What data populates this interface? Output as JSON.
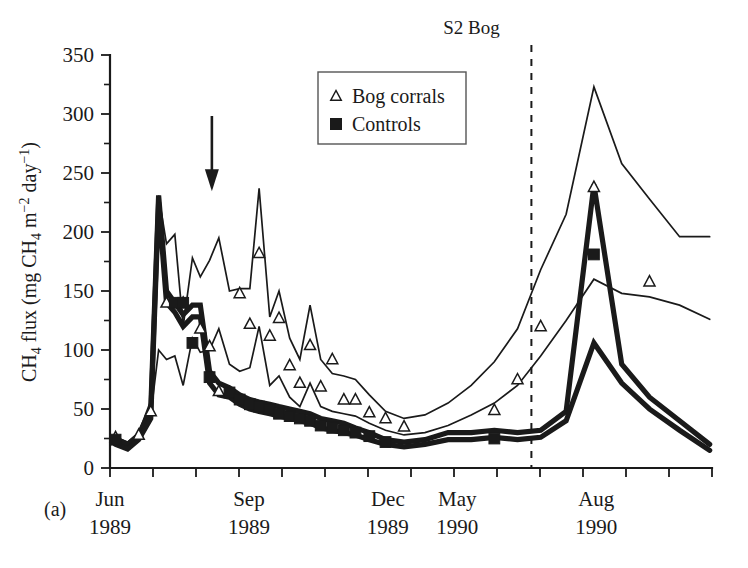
{
  "figure": {
    "panel_label": "(a)",
    "title": "S2 Bog"
  },
  "axes": {
    "y_label_parts": {
      "full": "CH4 flux (mg CH4 m-2 day-1)",
      "prefix": "CH",
      "sub1": "4",
      "mid": " flux (mg CH",
      "sub2": "4",
      "mid2": " m",
      "sup1": "−2",
      "mid3": " day",
      "sup2": "−1",
      "suffix": ")"
    },
    "y_ticks": [
      "0",
      "50",
      "100",
      "150",
      "200",
      "250",
      "300",
      "350"
    ],
    "y_minor_ticks": [
      25,
      75,
      125,
      175,
      225,
      275,
      325
    ],
    "y_range": [
      0,
      350
    ],
    "x_ticks": [
      {
        "label": "Jun",
        "year": "1989"
      },
      {
        "label": "Sep",
        "year": "1989"
      },
      {
        "label": "Dec",
        "year": "1989"
      },
      {
        "label": "May",
        "year": "1990"
      },
      {
        "label": "Aug",
        "year": "1990"
      }
    ],
    "x_tick_count": 14
  },
  "legend": {
    "position": "top-center-left",
    "entries": [
      {
        "label": "Bog corrals",
        "marker": "open-triangle"
      },
      {
        "label": "Controls",
        "marker": "filled-square"
      }
    ]
  },
  "annotations": {
    "arrow": {
      "name": "treatment-arrow",
      "x_index": 2.2,
      "y_top": 300,
      "y_bottom": 248
    },
    "divider": {
      "name": "year-break-divider",
      "x_index": 9.1,
      "style": "dashed"
    }
  },
  "chart_data": {
    "type": "line",
    "title": "S2 Bog",
    "xlabel": "",
    "ylabel": "CH4 flux (mg CH4 m-2 day-1)",
    "ylim": [
      0,
      350
    ],
    "xlim": [
      0,
      13
    ],
    "grid": false,
    "legend_position": "upper-center",
    "x_tick_positions": [
      0,
      3,
      6,
      7.5,
      10.5
    ],
    "x_tick_labels": [
      "Jun 1989",
      "Sep 1989",
      "Dec 1989",
      "May 1990",
      "Aug 1990"
    ],
    "series": [
      {
        "name": "Bog corrals upper envelope",
        "marker": "none",
        "style": "thin",
        "x": [
          0.12,
          0.38,
          0.62,
          0.88,
          1.05,
          1.22,
          1.4,
          1.58,
          1.78,
          1.95,
          2.15,
          2.35,
          2.58,
          2.8,
          3.02,
          3.22,
          3.45,
          3.65,
          3.88,
          4.1,
          4.32,
          4.55,
          4.8,
          5.05,
          5.3,
          5.6,
          5.95,
          6.35,
          6.8,
          7.3,
          7.8,
          8.3,
          8.8,
          9.3,
          9.85,
          10.45,
          11.05,
          11.65,
          12.3,
          12.95
        ],
        "y": [
          26,
          22,
          30,
          57,
          231,
          190,
          198,
          120,
          178,
          162,
          176,
          195,
          150,
          152,
          152,
          237,
          128,
          150,
          110,
          92,
          138,
          92,
          80,
          78,
          75,
          62,
          48,
          42,
          45,
          55,
          70,
          90,
          118,
          168,
          215,
          323,
          258,
          228,
          196,
          196
        ]
      },
      {
        "name": "Bog corrals lower envelope",
        "marker": "none",
        "style": "thin",
        "x": [
          0.12,
          0.38,
          0.62,
          0.88,
          1.05,
          1.22,
          1.4,
          1.58,
          1.78,
          1.95,
          2.15,
          2.35,
          2.58,
          2.8,
          3.02,
          3.22,
          3.45,
          3.65,
          3.88,
          4.1,
          4.32,
          4.55,
          4.8,
          5.05,
          5.3,
          5.6,
          5.95,
          6.35,
          6.8,
          7.3,
          7.8,
          8.3,
          8.8,
          9.3,
          9.85,
          10.45,
          11.05,
          11.65,
          12.3,
          12.95
        ],
        "y": [
          22,
          18,
          25,
          45,
          100,
          92,
          95,
          70,
          110,
          98,
          100,
          118,
          88,
          82,
          85,
          120,
          70,
          78,
          60,
          52,
          72,
          52,
          48,
          46,
          44,
          38,
          32,
          28,
          30,
          36,
          45,
          55,
          70,
          95,
          125,
          160,
          148,
          145,
          138,
          126
        ]
      },
      {
        "name": "Controls upper envelope",
        "marker": "none",
        "style": "thick",
        "x": [
          0.12,
          0.38,
          0.62,
          0.88,
          1.05,
          1.22,
          1.4,
          1.58,
          1.78,
          1.95,
          2.15,
          2.35,
          2.58,
          2.8,
          3.02,
          3.22,
          3.45,
          3.65,
          3.88,
          4.1,
          4.32,
          4.55,
          4.8,
          5.05,
          5.3,
          5.6,
          5.95,
          6.35,
          6.8,
          7.3,
          7.8,
          8.3,
          8.8,
          9.3,
          9.85,
          10.45,
          11.05,
          11.65,
          12.3,
          12.95
        ],
        "y": [
          25,
          20,
          28,
          50,
          231,
          150,
          140,
          130,
          138,
          138,
          82,
          72,
          68,
          62,
          58,
          56,
          54,
          52,
          50,
          48,
          46,
          42,
          40,
          38,
          34,
          30,
          24,
          22,
          24,
          30,
          30,
          32,
          30,
          32,
          48,
          240,
          88,
          60,
          40,
          20
        ]
      },
      {
        "name": "Controls lower envelope",
        "marker": "none",
        "style": "thick",
        "x": [
          0.12,
          0.38,
          0.62,
          0.88,
          1.05,
          1.22,
          1.4,
          1.58,
          1.78,
          1.95,
          2.15,
          2.35,
          2.58,
          2.8,
          3.02,
          3.22,
          3.45,
          3.65,
          3.88,
          4.1,
          4.32,
          4.55,
          4.8,
          5.05,
          5.3,
          5.6,
          5.95,
          6.35,
          6.8,
          7.3,
          7.8,
          8.3,
          8.8,
          9.3,
          9.85,
          10.45,
          11.05,
          11.65,
          12.3,
          12.95
        ],
        "y": [
          20,
          16,
          24,
          42,
          225,
          140,
          132,
          120,
          128,
          128,
          72,
          62,
          60,
          54,
          50,
          48,
          46,
          44,
          42,
          40,
          38,
          34,
          32,
          30,
          28,
          24,
          20,
          18,
          20,
          24,
          24,
          26,
          24,
          26,
          40,
          106,
          72,
          50,
          32,
          15
        ]
      }
    ],
    "markers": {
      "bog_corrals": {
        "symbol": "open-triangle",
        "points": [
          {
            "x": 0.12,
            "y": 26
          },
          {
            "x": 0.62,
            "y": 28
          },
          {
            "x": 0.88,
            "y": 48
          },
          {
            "x": 1.22,
            "y": 140
          },
          {
            "x": 1.58,
            "y": 140
          },
          {
            "x": 1.95,
            "y": 118
          },
          {
            "x": 2.15,
            "y": 103
          },
          {
            "x": 2.35,
            "y": 65
          },
          {
            "x": 2.8,
            "y": 148
          },
          {
            "x": 3.02,
            "y": 122
          },
          {
            "x": 3.22,
            "y": 182
          },
          {
            "x": 3.45,
            "y": 112
          },
          {
            "x": 3.65,
            "y": 127
          },
          {
            "x": 3.88,
            "y": 87
          },
          {
            "x": 4.1,
            "y": 72
          },
          {
            "x": 4.32,
            "y": 104
          },
          {
            "x": 4.55,
            "y": 69
          },
          {
            "x": 4.8,
            "y": 92
          },
          {
            "x": 5.05,
            "y": 58
          },
          {
            "x": 5.3,
            "y": 58
          },
          {
            "x": 5.6,
            "y": 47
          },
          {
            "x": 5.95,
            "y": 42
          },
          {
            "x": 6.35,
            "y": 35
          },
          {
            "x": 8.3,
            "y": 49
          },
          {
            "x": 8.8,
            "y": 75
          },
          {
            "x": 9.3,
            "y": 120
          },
          {
            "x": 10.45,
            "y": 238
          },
          {
            "x": 11.65,
            "y": 158
          }
        ]
      },
      "controls": {
        "symbol": "filled-square",
        "points": [
          {
            "x": 0.12,
            "y": 24
          },
          {
            "x": 1.4,
            "y": 140
          },
          {
            "x": 1.58,
            "y": 140
          },
          {
            "x": 1.78,
            "y": 106
          },
          {
            "x": 2.15,
            "y": 77
          },
          {
            "x": 2.58,
            "y": 64
          },
          {
            "x": 2.8,
            "y": 58
          },
          {
            "x": 3.02,
            "y": 54
          },
          {
            "x": 3.22,
            "y": 52
          },
          {
            "x": 3.45,
            "y": 50
          },
          {
            "x": 3.65,
            "y": 46
          },
          {
            "x": 3.88,
            "y": 44
          },
          {
            "x": 4.1,
            "y": 42
          },
          {
            "x": 4.32,
            "y": 40
          },
          {
            "x": 4.55,
            "y": 36
          },
          {
            "x": 4.8,
            "y": 34
          },
          {
            "x": 5.05,
            "y": 32
          },
          {
            "x": 5.3,
            "y": 30
          },
          {
            "x": 5.6,
            "y": 27
          },
          {
            "x": 5.95,
            "y": 22
          },
          {
            "x": 8.3,
            "y": 25
          },
          {
            "x": 10.45,
            "y": 181
          }
        ]
      }
    }
  }
}
